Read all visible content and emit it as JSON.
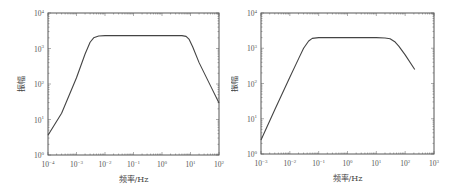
{
  "chart_data": [
    {
      "type": "line",
      "title": "",
      "xlabel": "频率/Hz",
      "ylabel": "振幅",
      "xscale": "log",
      "yscale": "log",
      "xlim": [
        0.0001,
        100
      ],
      "ylim": [
        1,
        10000
      ],
      "xticks": [
        "10^-4",
        "10^-3",
        "10^-2",
        "10^-1",
        "10^0",
        "10^1",
        "10^2"
      ],
      "yticks": [
        "10^0",
        "10^1",
        "10^2",
        "10^3",
        "10^4"
      ],
      "grid": false,
      "legend": null,
      "series": [
        {
          "name": "amplitude",
          "x": [
            0.0001,
            0.0003,
            0.001,
            0.002,
            0.003,
            0.004,
            0.006,
            0.01,
            0.1,
            1,
            3,
            5,
            7,
            9,
            12,
            20,
            50,
            100
          ],
          "y": [
            3.6,
            15,
            150,
            700,
            1500,
            2000,
            2250,
            2300,
            2300,
            2300,
            2300,
            2300,
            2200,
            1800,
            1100,
            400,
            90,
            29
          ]
        }
      ]
    },
    {
      "type": "line",
      "title": "",
      "xlabel": "频率/Hz",
      "ylabel": "振幅",
      "xscale": "log",
      "yscale": "log",
      "xlim": [
        0.001,
        1000
      ],
      "ylim": [
        1,
        10000
      ],
      "xticks": [
        "10^-3",
        "10^-2",
        "10^-1",
        "10^0",
        "10^1",
        "10^2",
        "10^3"
      ],
      "yticks": [
        "10^0",
        "10^1",
        "10^2",
        "10^3",
        "10^4"
      ],
      "grid": false,
      "legend": null,
      "series": [
        {
          "name": "amplitude",
          "x": [
            0.001,
            0.003,
            0.01,
            0.02,
            0.03,
            0.045,
            0.06,
            0.1,
            1,
            10,
            20,
            30,
            45,
            60,
            100,
            215
          ],
          "y": [
            2.5,
            18,
            150,
            500,
            1000,
            1600,
            1900,
            2000,
            2000,
            2000,
            1950,
            1850,
            1500,
            1150,
            650,
            250
          ]
        }
      ]
    }
  ]
}
